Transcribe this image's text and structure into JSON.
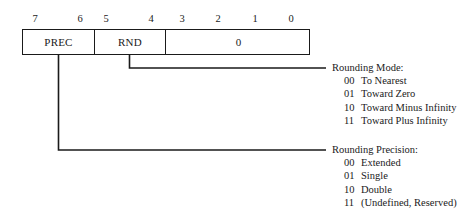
{
  "diagram": {
    "line_color": "#1a1a1a",
    "background_color": "#ffffff"
  },
  "register": {
    "bit_labels": [
      "7",
      "6",
      "5",
      "4",
      "3",
      "2",
      "1",
      "0"
    ],
    "fields": [
      {
        "name": "PREC",
        "label": "PREC",
        "bits": "7-6"
      },
      {
        "name": "RND",
        "label": "RND",
        "bits": "5-4"
      },
      {
        "name": "RESERVED",
        "label": "0",
        "bits": "3-0"
      }
    ]
  },
  "legends": [
    {
      "key": "rounding_mode",
      "title": "Rounding Mode:",
      "entries": [
        {
          "code": "00",
          "text": "To Nearest"
        },
        {
          "code": "01",
          "text": "Toward Zero"
        },
        {
          "code": "10",
          "text": "Toward Minus Infinity"
        },
        {
          "code": "11",
          "text": "Toward Plus Infinity"
        }
      ]
    },
    {
      "key": "rounding_precision",
      "title": "Rounding Precision:",
      "entries": [
        {
          "code": "00",
          "text": "Extended"
        },
        {
          "code": "01",
          "text": "Single"
        },
        {
          "code": "10",
          "text": "Double"
        },
        {
          "code": "11",
          "text": "(Undefined, Reserved)"
        }
      ]
    }
  ]
}
